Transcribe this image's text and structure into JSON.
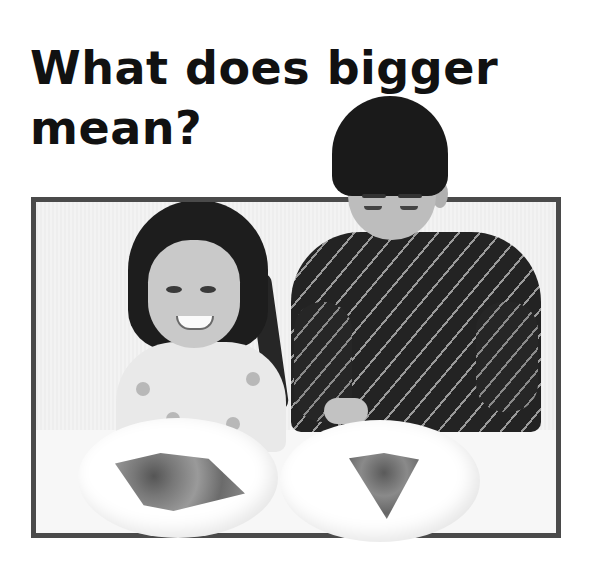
{
  "page": {
    "title_line1": "What does bigger",
    "title_line2": "mean?"
  },
  "photo": {
    "description": "Girl and boy at a table comparing a bigger pizza slice and a smaller pizza slice on two plates",
    "frame_color": "#4a4a4a",
    "subjects": [
      "girl",
      "boy"
    ],
    "plates": [
      {
        "position": "left",
        "item": "bigger pizza slice"
      },
      {
        "position": "right",
        "item": "smaller pizza slice"
      }
    ]
  }
}
